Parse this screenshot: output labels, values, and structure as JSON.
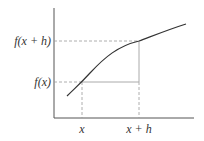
{
  "diagram": {
    "labels": {
      "y_upper": "f(x + h)",
      "y_lower": "f(x)",
      "x_left": "x",
      "x_right": "x + h"
    },
    "colors": {
      "axis": "#555555",
      "curve": "#333333",
      "dashed": "#999999",
      "secant_legs": "#aaaaaa",
      "text": "#333333"
    },
    "geometry": {
      "axis_origin": [
        54,
        118
      ],
      "axis_top": [
        54,
        8
      ],
      "axis_right": [
        194,
        118
      ],
      "point_x": [
        82,
        82
      ],
      "point_xh": [
        139,
        41
      ],
      "curve_start": [
        67,
        96
      ],
      "curve_end": [
        186,
        24
      ]
    }
  }
}
